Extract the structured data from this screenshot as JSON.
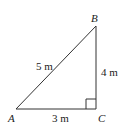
{
  "diagram": {
    "type": "right-triangle",
    "vertices": {
      "A": {
        "label": "A"
      },
      "B": {
        "label": "B"
      },
      "C": {
        "label": "C"
      }
    },
    "sides": {
      "AB": {
        "label": "5 m"
      },
      "BC": {
        "label": "4 m"
      },
      "AC": {
        "label": "3 m"
      }
    },
    "right_angle_at": "C",
    "stroke_color": "#333333"
  }
}
